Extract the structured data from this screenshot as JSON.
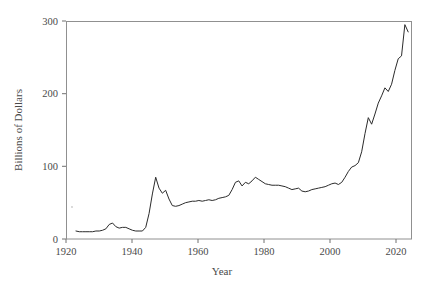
{
  "chart_data": {
    "type": "line",
    "title": "",
    "xlabel": "Year",
    "ylabel": "Billions of Dollars",
    "xlim": [
      1920,
      2024
    ],
    "ylim": [
      0,
      300
    ],
    "grid": false,
    "legend": null,
    "xticks": [
      1920,
      1940,
      1960,
      1980,
      2000,
      2020
    ],
    "xtick_labels": [
      "1920",
      "1940",
      "1960",
      "1980",
      "2000",
      "2020"
    ],
    "yticks": [
      0,
      100,
      200,
      300
    ],
    "ytick_labels": [
      "0",
      "100",
      "200",
      "300"
    ],
    "series": [
      {
        "name": "Billions of Dollars",
        "color": "#2b2b2b",
        "x": [
          1923,
          1924,
          1925,
          1926,
          1927,
          1928,
          1929,
          1930,
          1931,
          1932,
          1933,
          1934,
          1935,
          1936,
          1937,
          1938,
          1939,
          1940,
          1941,
          1942,
          1943,
          1944,
          1945,
          1946,
          1947,
          1948,
          1949,
          1950,
          1951,
          1952,
          1953,
          1954,
          1955,
          1956,
          1957,
          1958,
          1959,
          1960,
          1961,
          1962,
          1963,
          1964,
          1965,
          1966,
          1967,
          1968,
          1969,
          1970,
          1971,
          1972,
          1973,
          1974,
          1975,
          1976,
          1977,
          1978,
          1979,
          1980,
          1981,
          1982,
          1983,
          1984,
          1985,
          1986,
          1987,
          1988,
          1989,
          1990,
          1991,
          1992,
          1993,
          1994,
          1995,
          1996,
          1997,
          1998,
          1999,
          2000,
          2001,
          2002,
          2003,
          2004,
          2005,
          2006,
          2007,
          2008,
          2009,
          2010,
          2011,
          2012,
          2013,
          2014,
          2015,
          2016,
          2017,
          2018,
          2019,
          2020,
          2021,
          2022,
          2023
        ],
        "y": [
          11,
          10,
          10,
          10,
          10,
          10,
          11,
          11,
          12,
          14,
          20,
          22,
          17,
          15,
          16,
          16,
          14,
          12,
          11,
          11,
          11,
          16,
          35,
          62,
          85,
          70,
          63,
          67,
          55,
          46,
          45,
          46,
          48,
          50,
          51,
          52,
          52,
          53,
          52,
          53,
          54,
          53,
          54,
          56,
          57,
          58,
          60,
          68,
          78,
          80,
          73,
          78,
          76,
          80,
          85,
          82,
          79,
          76,
          75,
          74,
          74,
          74,
          73,
          72,
          70,
          68,
          69,
          70,
          66,
          65,
          66,
          68,
          69,
          70,
          71,
          72,
          74,
          76,
          77,
          75,
          78,
          85,
          93,
          99,
          101,
          105,
          120,
          145,
          167,
          158,
          172,
          187,
          197,
          208,
          203,
          213,
          232,
          248,
          252,
          295,
          285
        ]
      }
    ],
    "annotations": []
  },
  "axis": {
    "x_title": "Year",
    "y_title": "Billions of Dollars"
  }
}
